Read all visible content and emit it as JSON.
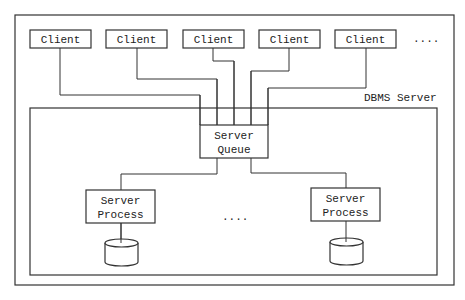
{
  "diagram": {
    "clients": [
      {
        "label": "Client"
      },
      {
        "label": "Client"
      },
      {
        "label": "Client"
      },
      {
        "label": "Client"
      },
      {
        "label": "Client"
      }
    ],
    "clients_ellipsis": "....",
    "server_container_label": "DBMS Server",
    "queue": {
      "line1": "Server",
      "line2": "Queue"
    },
    "processes": [
      {
        "line1": "Server",
        "line2": "Process"
      },
      {
        "line1": "Server",
        "line2": "Process"
      }
    ],
    "processes_ellipsis": "....",
    "colors": {
      "stroke": "#333333",
      "background": "#ffffff",
      "text": "#222222"
    }
  }
}
